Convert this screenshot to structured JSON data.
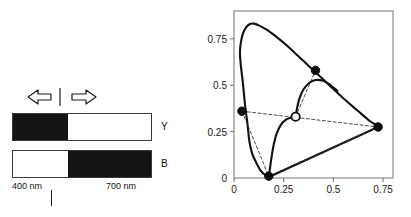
{
  "figure": {
    "left_panel": {
      "arrows": {
        "left_arrow_icon": "arrow-left-icon",
        "right_arrow_icon": "arrow-right-icon",
        "divider_icon": "vertical-divider-icon"
      },
      "bars": [
        {
          "name": "Y",
          "label": "Y",
          "dark_from": 0.0,
          "dark_to": 0.4
        },
        {
          "name": "B",
          "label": "B",
          "dark_from": 0.4,
          "dark_to": 1.0
        }
      ],
      "axis": {
        "left_label": "400 nm",
        "right_label": "700 nm",
        "tick_position_fraction": 0.28
      }
    }
  },
  "chart_data": {
    "type": "scatter",
    "title": "",
    "xlabel": "",
    "ylabel": "",
    "xlim": [
      0,
      0.8
    ],
    "ylim": [
      0,
      0.9
    ],
    "grid": false,
    "legend": null,
    "xticks": [
      0,
      0.25,
      0.5,
      0.75
    ],
    "xticklabels": [
      "0",
      "0.25",
      "0.5",
      "0.75"
    ],
    "yticks": [
      0,
      0.25,
      0.5,
      0.75
    ],
    "yticklabels": [
      "0",
      "0.25",
      "0.5",
      "0.75"
    ],
    "series": [
      {
        "name": "spectral-locus",
        "type": "line",
        "style": "solid",
        "points": [
          [
            0.175,
            0.005
          ],
          [
            0.152,
            0.02
          ],
          [
            0.135,
            0.039
          ],
          [
            0.124,
            0.058
          ],
          [
            0.11,
            0.087
          ],
          [
            0.091,
            0.133
          ],
          [
            0.077,
            0.2
          ],
          [
            0.068,
            0.29
          ],
          [
            0.055,
            0.4
          ],
          [
            0.045,
            0.51
          ],
          [
            0.035,
            0.6
          ],
          [
            0.03,
            0.67
          ],
          [
            0.033,
            0.72
          ],
          [
            0.044,
            0.775
          ],
          [
            0.06,
            0.81
          ],
          [
            0.08,
            0.83
          ],
          [
            0.1,
            0.832
          ],
          [
            0.13,
            0.82
          ],
          [
            0.17,
            0.795
          ],
          [
            0.22,
            0.755
          ],
          [
            0.27,
            0.71
          ],
          [
            0.32,
            0.66
          ],
          [
            0.38,
            0.6
          ],
          [
            0.44,
            0.54
          ],
          [
            0.5,
            0.48
          ],
          [
            0.56,
            0.42
          ],
          [
            0.62,
            0.365
          ],
          [
            0.68,
            0.31
          ],
          [
            0.705,
            0.292
          ],
          [
            0.725,
            0.275
          ]
        ]
      },
      {
        "name": "purple-line",
        "type": "line",
        "style": "solid",
        "points": [
          [
            0.725,
            0.275
          ],
          [
            0.175,
            0.005
          ]
        ]
      },
      {
        "name": "inner-curve-lower",
        "type": "line",
        "style": "solid",
        "points": [
          [
            0.175,
            0.01
          ],
          [
            0.182,
            0.06
          ],
          [
            0.19,
            0.12
          ],
          [
            0.2,
            0.18
          ],
          [
            0.215,
            0.24
          ],
          [
            0.235,
            0.285
          ],
          [
            0.258,
            0.312
          ],
          [
            0.285,
            0.325
          ],
          [
            0.31,
            0.33
          ]
        ]
      },
      {
        "name": "inner-curve-upper",
        "type": "line",
        "style": "solid",
        "points": [
          [
            0.31,
            0.33
          ],
          [
            0.318,
            0.38
          ],
          [
            0.33,
            0.43
          ],
          [
            0.35,
            0.478
          ],
          [
            0.378,
            0.512
          ],
          [
            0.41,
            0.528
          ],
          [
            0.445,
            0.525
          ],
          [
            0.48,
            0.505
          ],
          [
            0.52,
            0.47
          ]
        ]
      },
      {
        "name": "gamut-triangle",
        "type": "line",
        "style": "dashed",
        "points": [
          [
            0.04,
            0.36
          ],
          [
            0.725,
            0.275
          ],
          [
            0.175,
            0.01
          ],
          [
            0.04,
            0.36
          ]
        ]
      },
      {
        "name": "white-point-spokes",
        "type": "line",
        "style": "dashed",
        "points": [
          [
            0.31,
            0.33
          ],
          [
            0.41,
            0.58
          ]
        ]
      },
      {
        "name": "markers-filled",
        "type": "scatter",
        "marker": "filled-circle",
        "points": [
          [
            0.04,
            0.36
          ],
          [
            0.41,
            0.58
          ],
          [
            0.725,
            0.275
          ],
          [
            0.175,
            0.01
          ]
        ]
      },
      {
        "name": "white-point",
        "type": "scatter",
        "marker": "open-circle",
        "points": [
          [
            0.31,
            0.33
          ]
        ]
      }
    ]
  }
}
